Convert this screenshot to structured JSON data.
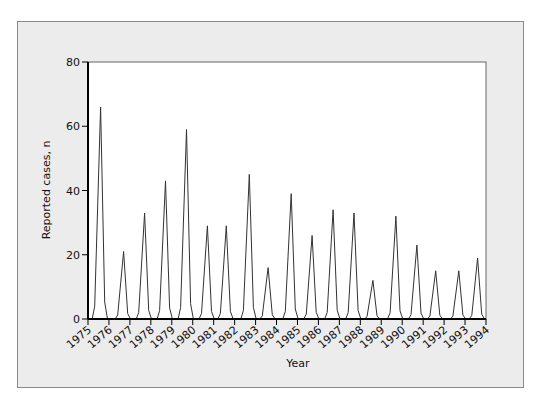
{
  "chart_data": {
    "type": "line",
    "title": "",
    "xlabel": "Year",
    "ylabel": "Reported cases, n",
    "ylim": [
      0,
      80
    ],
    "xlim": [
      1975,
      1994
    ],
    "yticks": [
      0,
      20,
      40,
      60,
      80
    ],
    "xticks": [
      "1975",
      "1976",
      "1977",
      "1978",
      "1979",
      "1980",
      "1981",
      "1982",
      "1983",
      "1984",
      "1985",
      "1986",
      "1987",
      "1988",
      "1989",
      "1990",
      "1991",
      "1992",
      "1993",
      "1994"
    ],
    "grid": false,
    "legend": null,
    "series": [
      {
        "name": "Reported cases",
        "peaks": [
          {
            "x": 1975.6,
            "y": 66
          },
          {
            "x": 1976.7,
            "y": 21
          },
          {
            "x": 1977.7,
            "y": 33
          },
          {
            "x": 1978.7,
            "y": 43
          },
          {
            "x": 1979.7,
            "y": 59
          },
          {
            "x": 1980.7,
            "y": 29
          },
          {
            "x": 1981.6,
            "y": 29
          },
          {
            "x": 1982.7,
            "y": 45
          },
          {
            "x": 1983.6,
            "y": 16
          },
          {
            "x": 1984.7,
            "y": 39
          },
          {
            "x": 1985.7,
            "y": 26
          },
          {
            "x": 1986.7,
            "y": 34
          },
          {
            "x": 1987.7,
            "y": 33
          },
          {
            "x": 1988.6,
            "y": 12
          },
          {
            "x": 1989.7,
            "y": 32
          },
          {
            "x": 1990.7,
            "y": 23
          },
          {
            "x": 1991.6,
            "y": 15
          },
          {
            "x": 1992.7,
            "y": 15
          },
          {
            "x": 1993.6,
            "y": 19
          }
        ]
      }
    ]
  },
  "colors": {
    "frame_bg": "#ececec",
    "plot_bg": "#ffffff",
    "line": "#333333",
    "axis": "#000000"
  }
}
